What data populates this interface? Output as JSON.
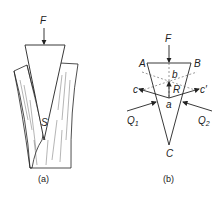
{
  "figure_a": {
    "caption": "(a)",
    "labels": {
      "force": "F",
      "point": "S"
    },
    "description": "Wedge driven by force F into a split log; contact point S"
  },
  "figure_b": {
    "caption": "(b)",
    "labels": {
      "force": "F",
      "vertex_top_left": "A",
      "vertex_top_right": "B",
      "vertex_bottom": "C",
      "point_b": "b",
      "point_a": "a",
      "resultant": "R",
      "line_c": "c",
      "line_c_prime": "c′",
      "reaction_1": "Q",
      "reaction_1_sub": "1",
      "reaction_2": "Q",
      "reaction_2_sub": "2"
    },
    "description": "Force diagram of wedge ABC with reactions Q1, Q2 and resultant R"
  },
  "colors": {
    "stroke": "#222222",
    "dashed": "#555555",
    "background": "#ffffff"
  }
}
